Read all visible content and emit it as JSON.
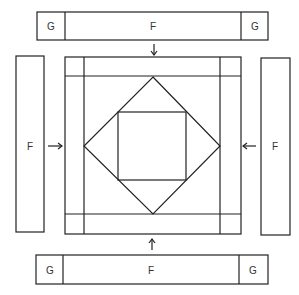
{
  "diagram": {
    "top_strip": {
      "left_label": "G",
      "center_label": "F",
      "right_label": "G"
    },
    "bottom_strip": {
      "left_label": "G",
      "center_label": "F",
      "right_label": "G"
    },
    "left_strip": {
      "label": "F"
    },
    "right_strip": {
      "label": "F"
    },
    "arrows": [
      "arrow-down",
      "arrow-up",
      "arrow-right",
      "arrow-left"
    ],
    "line_color": "#222222"
  }
}
